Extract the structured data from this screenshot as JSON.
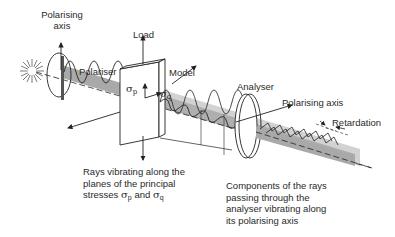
{
  "labels": {
    "polarising_axis_left_1": "Polarising",
    "polarising_axis_left_2": "axis",
    "polariser": "Polariser",
    "load": "Load",
    "model": "Model",
    "sigma": "σ",
    "sigma_p_sub": "p",
    "sigma_q_sub": "q",
    "analyser": "Analyser",
    "polarising_axis_right": "Polarising axis",
    "retardation": "Retardation"
  },
  "captions": {
    "left": {
      "line1": "Rays vibrating along the",
      "line2": "planes of the principal",
      "line3_prefix": "stresses ",
      "line3_mid": " and "
    },
    "right": {
      "line1": "Components of the rays",
      "line2": "passing through the",
      "line3": "analyser vibrating along",
      "line4": "its polarising axis"
    }
  },
  "colors": {
    "beam": "#a9a9a9",
    "line": "#222222",
    "background": "#ffffff"
  }
}
